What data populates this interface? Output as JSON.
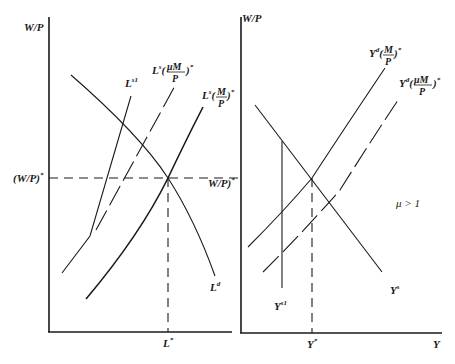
{
  "left_panel": {
    "y_axis_label": "W/P",
    "x_axis_tick_label": "L*",
    "y_axis_tick_label": "(W/P)*",
    "curves": {
      "ls1": {
        "label": "L",
        "sup": "s1"
      },
      "ls_mu": {
        "label": "L",
        "sup": "s",
        "arg": "(μM/P)*",
        "num": "μM",
        "den": "P"
      },
      "ls": {
        "label": "L",
        "sup": "s",
        "arg": "(M/P)*",
        "num": "M",
        "den": "P"
      },
      "ld": {
        "label": "L",
        "sup": "d"
      }
    }
  },
  "right_panel": {
    "y_axis_label": "W/P",
    "x_axis_label": "Y",
    "x_axis_tick_label": "Y*",
    "y_axis_tick_label": "W/P)*",
    "annotation": "μ > 1",
    "curves": {
      "yd": {
        "label": "Y",
        "sup": "d",
        "arg": "(M/P)*",
        "num": "M",
        "den": "P"
      },
      "yd_mu": {
        "label": "Y",
        "sup": "d",
        "arg": "(μM/P)*",
        "num": "μM",
        "den": "P"
      },
      "ys": {
        "label": "Y",
        "sup": "s"
      },
      "ys1": {
        "label": "Y",
        "sup": "s1"
      }
    }
  },
  "labels": {
    "left_y": "W/P",
    "left_y_tick": "(W/P)",
    "left_y_tick_star": "*",
    "left_x_tick": "L",
    "left_x_tick_star": "*",
    "right_y": "W/P",
    "right_y_tick": "W/P)",
    "right_y_tick_star": "*",
    "right_x": "Y",
    "right_x_tick": "Y",
    "right_x_tick_star": "*",
    "mu": "μ > 1",
    "L": "L",
    "Y": "Y",
    "s1": "s1",
    "s": "s",
    "d": "d",
    "paren_open": "(",
    "paren_close": ")",
    "star": "*",
    "M": "M",
    "muM": "μM",
    "P": "P"
  }
}
